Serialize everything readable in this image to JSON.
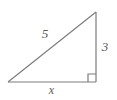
{
  "figure": {
    "type": "right-triangle-diagram",
    "background_color": "#ffffff",
    "stroke_color": "#7d7d7d",
    "label_color": "#5a5a5a",
    "labels": {
      "hypotenuse": "5",
      "vertical_leg": "3",
      "horizontal_leg": "x"
    },
    "markers": {
      "right_angle": "right-angle-square"
    },
    "geometry": {
      "left_vertex": [
        8,
        82
      ],
      "bottom_right_vertex": [
        96,
        82
      ],
      "top_right_vertex": [
        96,
        12
      ],
      "right_angle_square_size": 8
    }
  }
}
